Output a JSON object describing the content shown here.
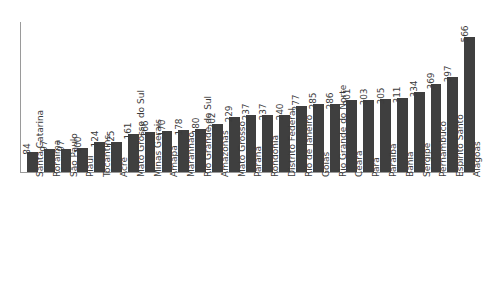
{
  "chart": {
    "type": "bar",
    "title": "",
    "orientation": "vertical",
    "bar_color": "#3f3f3f",
    "axis_color": "#9a9a9a",
    "background_color": "#ffffff",
    "value_label_rotation": "vertical",
    "category_label_rotation": "vertical"
  },
  "chart_data": {
    "type": "bar",
    "title": "",
    "subtitle": "",
    "xlabel": "",
    "ylabel": "",
    "grid": false,
    "legend": false,
    "ylim": [
      0,
      566
    ],
    "axis_ticks": [],
    "categories": [
      "Santa Catarina",
      "Roraima",
      "São Paulo",
      "Piauí",
      "Tocantins",
      "Acre",
      "Mato Grosso do Sul",
      "Minas Gerais",
      "Amapá",
      "Maranhão",
      "Rio Grande do Sul",
      "Amazonas",
      "Mato Grosso",
      "Paraná",
      "Rondônia",
      "Distrito Federal",
      "Rio de Janeiro",
      "Goiás",
      "Rio Grande do Norte",
      "Ceará",
      "Pará",
      "Paraíba",
      "Bahia",
      "Sergipe",
      "Pernambuco",
      "Espírito Santo",
      "Alagoas"
    ],
    "values": [
      84,
      97,
      97,
      100,
      124,
      125,
      161,
      166,
      170,
      178,
      180,
      202,
      229,
      237,
      237,
      240,
      277,
      285,
      286,
      301,
      303,
      305,
      311,
      334,
      369,
      397,
      566
    ],
    "value_labels": [
      "84",
      "97",
      "97",
      "100",
      "124",
      "125",
      "161",
      "166",
      "170",
      "178",
      "180",
      "202",
      "229",
      "237",
      "237",
      "240",
      "277",
      "285",
      "286",
      "301",
      "303",
      "305",
      "311",
      "334",
      "369",
      "397",
      "566"
    ]
  }
}
